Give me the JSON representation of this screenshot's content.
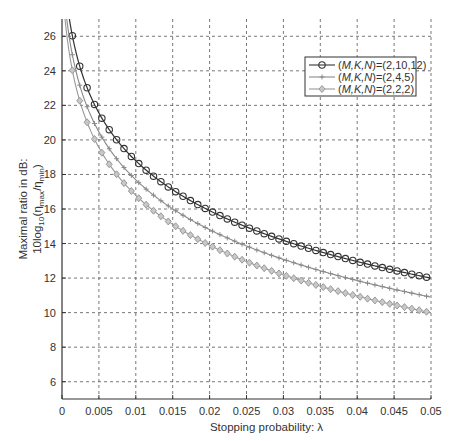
{
  "chart_data": {
    "type": "line",
    "title": "",
    "xlabel": "Stopping probability: λ",
    "ylabel_line1": "Maximal ratio in dB:",
    "ylabel_line2_parts": [
      "10log",
      "10",
      "(η",
      "max",
      "/η",
      "min",
      ")"
    ],
    "xlim": [
      0,
      0.05
    ],
    "ylim": [
      5,
      27
    ],
    "xticks": [
      0,
      0.005,
      0.01,
      0.015,
      0.02,
      0.025,
      0.03,
      0.035,
      0.04,
      0.045,
      0.05
    ],
    "xtick_labels": [
      "0",
      "0.005",
      "0.01",
      "0.015",
      "0.02",
      "0.025",
      "0.03",
      "0.035",
      "0.04",
      "0.045",
      "0.05"
    ],
    "yticks": [
      6,
      8,
      10,
      12,
      14,
      16,
      18,
      20,
      22,
      24,
      26
    ],
    "grid": true,
    "legend_position": "upper right",
    "series": [
      {
        "name": "(M,K,N)=(2,10,12)",
        "name_italic": "M,K,N",
        "name_value": "=(2,10,12)",
        "color": "#333333",
        "marker": "circle",
        "end_value": 12.0,
        "x": [
          0.0014,
          0.0024,
          0.0034,
          0.0044,
          0.005,
          0.01,
          0.015,
          0.02,
          0.025,
          0.03,
          0.035,
          0.04,
          0.045,
          0.05
        ],
        "values": [
          26.0,
          24.3,
          23.0,
          22.0,
          21.6,
          18.9,
          17.2,
          15.9,
          15.0,
          14.2,
          13.5,
          12.9,
          12.4,
          12.0
        ]
      },
      {
        "name": "(M,K,N)=(2,4,5)",
        "name_italic": "M,K,N",
        "name_value": "=(2,4,5)",
        "color": "#8a8a8a",
        "marker": "plus",
        "end_value": 10.9,
        "x": [
          0.0014,
          0.0024,
          0.0034,
          0.0044,
          0.005,
          0.01,
          0.015,
          0.02,
          0.025,
          0.03,
          0.035,
          0.04,
          0.045,
          0.05
        ],
        "values": [
          24.9,
          23.2,
          21.9,
          20.9,
          20.5,
          17.8,
          16.1,
          14.8,
          13.9,
          13.1,
          12.4,
          11.8,
          11.3,
          10.9
        ]
      },
      {
        "name": "(M,K,N)=(2,2,2)",
        "name_italic": "M,K,N",
        "name_value": "=(2,2,2)",
        "color": "#999999",
        "marker": "diamond",
        "end_value": 10.0,
        "x": [
          0.0014,
          0.0024,
          0.0034,
          0.0044,
          0.005,
          0.01,
          0.015,
          0.02,
          0.025,
          0.03,
          0.035,
          0.04,
          0.045,
          0.05
        ],
        "values": [
          24.0,
          22.3,
          21.0,
          20.0,
          19.6,
          16.9,
          15.2,
          13.9,
          13.0,
          12.2,
          11.5,
          10.9,
          10.4,
          10.0
        ]
      }
    ],
    "model": {
      "form": "end_value + 10*log10((0.05+c)/(lambda+c))",
      "c": 0.0006
    }
  }
}
